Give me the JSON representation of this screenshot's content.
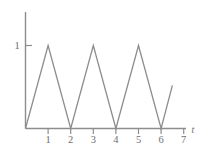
{
  "chart_data": {
    "type": "line",
    "title": "",
    "subtitle": "",
    "xlabel": "t",
    "ylabel": "",
    "xlim": [
      0,
      7.4
    ],
    "ylim": [
      0,
      1.22
    ],
    "grid": false,
    "legend": null,
    "x_ticks": [
      1,
      2,
      3,
      4,
      5,
      6,
      7
    ],
    "x_tick_labels": [
      "1",
      "2",
      "3",
      "4",
      "5",
      "6",
      "7"
    ],
    "y_ticks": [
      1
    ],
    "y_tick_labels": [
      "1"
    ],
    "series": [
      {
        "name": "triangle wave",
        "color": "#8d8d8d",
        "x": [
          0,
          1,
          2,
          3,
          4,
          5,
          6,
          6.5
        ],
        "y": [
          0,
          1,
          0,
          1,
          0,
          1,
          0,
          0.52
        ]
      }
    ],
    "axes_color": "#8d8d8d",
    "label_color": "#6f6f6f",
    "background": "#ffffff"
  },
  "axis_name_label": "t"
}
